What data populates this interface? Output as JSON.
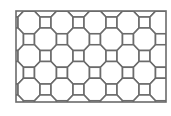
{
  "figure": {
    "frame": {
      "x": 16,
      "y": 11,
      "width": 150,
      "height": 91
    },
    "stroke_color": "#6b6b6b",
    "fill_color": "#ffffff",
    "stroke_width": 1.6,
    "lattice": {
      "origin_x": 12.5,
      "origin_y": 22.5,
      "dx": 16.5,
      "dy": 16.75,
      "cols": 11,
      "rows": 7
    },
    "square_half_size": 5.5
  }
}
